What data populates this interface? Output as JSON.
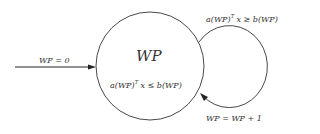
{
  "diagram": {
    "state": {
      "name": "WP",
      "condition_prefix": "a(WP)",
      "condition_sup": "T",
      "condition_suffix": "x ≤ b(WP)"
    },
    "entry": {
      "label": "WP = 0"
    },
    "loop": {
      "condition_prefix": "a(WP)",
      "condition_sup": "T",
      "condition_suffix": "x ≥ b(WP)",
      "update_label": "WP = WP + 1"
    },
    "colors": {
      "stroke": "#333333",
      "background": "#ffffff"
    }
  }
}
